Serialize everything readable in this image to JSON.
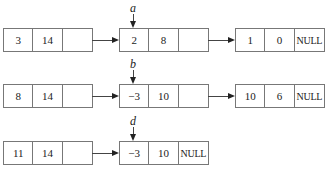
{
  "rows": [
    {
      "pointer_label": "a",
      "nodes": [
        {
          "cells": [
            "3",
            "14",
            ""
          ]
        },
        {
          "cells": [
            "2",
            "8",
            ""
          ]
        },
        {
          "cells": [
            "1",
            "0",
            "NULL"
          ]
        }
      ]
    },
    {
      "pointer_label": "b",
      "nodes": [
        {
          "cells": [
            "8",
            "14",
            ""
          ]
        },
        {
          "cells": [
            "−3",
            "10",
            ""
          ]
        },
        {
          "cells": [
            "10",
            "6",
            "NULL"
          ]
        }
      ]
    },
    {
      "pointer_label": "d",
      "nodes": [
        {
          "cells": [
            "11",
            "14",
            ""
          ]
        },
        {
          "cells": [
            "−3",
            "10",
            "NULL"
          ]
        }
      ]
    }
  ]
}
